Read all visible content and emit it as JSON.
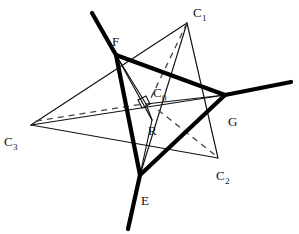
{
  "figure": {
    "type": "geometric-diagram",
    "background_color": "#ffffff",
    "stroke_color": "#111111",
    "canvas": {
      "width": 299,
      "height": 234
    },
    "labels": {
      "c1": {
        "text": "C",
        "sub": "1",
        "x": 193,
        "y": 17
      },
      "c0": {
        "text": "C",
        "sub": "0",
        "x": 153,
        "y": 97
      },
      "c2": {
        "text": "C",
        "sub": "2",
        "x": 216,
        "y": 180
      },
      "c3": {
        "text": "C",
        "sub": "3",
        "x": 4,
        "y": 146
      },
      "f": {
        "text": "F",
        "x": 112,
        "y": 46
      },
      "g": {
        "text": "G",
        "x": 228,
        "y": 126
      },
      "e": {
        "text": "E",
        "x": 141,
        "y": 205
      },
      "r": {
        "text": "R",
        "x": 148,
        "y": 135
      }
    },
    "vertices": {
      "C1": {
        "x": 187,
        "y": 23
      },
      "C2": {
        "x": 218,
        "y": 158
      },
      "C3": {
        "x": 31,
        "y": 125
      },
      "C0": {
        "x": 146,
        "y": 104
      },
      "F": {
        "x": 116,
        "y": 55
      },
      "G": {
        "x": 225,
        "y": 95
      },
      "E": {
        "x": 140,
        "y": 175
      },
      "R": {
        "x": 152,
        "y": 120
      }
    },
    "thick_edges": [
      {
        "name": "F-ray-upper-left",
        "from": [
          92,
          13
        ],
        "to": [
          116,
          55
        ]
      },
      {
        "name": "G-ray-right",
        "from": [
          225,
          95
        ],
        "to": [
          291,
          82
        ]
      },
      {
        "name": "E-ray-lower-left",
        "from": [
          140,
          175
        ],
        "to": [
          128,
          229
        ]
      },
      {
        "name": "F-to-G",
        "from": [
          116,
          55
        ],
        "to": [
          225,
          95
        ]
      },
      {
        "name": "G-to-E",
        "from": [
          225,
          95
        ],
        "to": [
          140,
          175
        ]
      },
      {
        "name": "E-to-F",
        "from": [
          140,
          175
        ],
        "to": [
          116,
          55
        ]
      }
    ],
    "thin_edges": [
      {
        "name": "C3-to-C1",
        "from": [
          31,
          125
        ],
        "to": [
          187,
          23
        ]
      },
      {
        "name": "C1-to-C2",
        "from": [
          187,
          23
        ],
        "to": [
          218,
          158
        ]
      },
      {
        "name": "C2-to-C3",
        "from": [
          218,
          158
        ],
        "to": [
          31,
          125
        ]
      },
      {
        "name": "C3-to-G",
        "from": [
          31,
          125
        ],
        "to": [
          225,
          95
        ]
      },
      {
        "name": "C1-to-E",
        "from": [
          187,
          23
        ],
        "to": [
          140,
          175
        ]
      },
      {
        "name": "F-inner-to-R",
        "from": [
          116,
          55
        ],
        "to": [
          152,
          120
        ]
      },
      {
        "name": "R-to-C0",
        "from": [
          152,
          120
        ],
        "to": [
          146,
          104
        ]
      },
      {
        "name": "R-to-E",
        "from": [
          152,
          120
        ],
        "to": [
          140,
          175
        ]
      },
      {
        "name": "C0-to-G",
        "from": [
          146,
          104
        ],
        "to": [
          225,
          95
        ]
      },
      {
        "name": "F-to-C0",
        "from": [
          116,
          55
        ],
        "to": [
          146,
          104
        ]
      }
    ],
    "dashed_edges": [
      {
        "name": "C1-to-C0",
        "from": [
          187,
          23
        ],
        "to": [
          150,
          100
        ]
      },
      {
        "name": "C3-to-C0",
        "from": [
          36,
          121
        ],
        "to": [
          143,
          104
        ]
      },
      {
        "name": "C0-to-C2",
        "from": [
          158,
          110
        ],
        "to": [
          215,
          155
        ]
      }
    ],
    "right_angle_marker": {
      "name": "right-angle-at-C0",
      "points": "138,100 146,96 150,104 142,108"
    }
  }
}
